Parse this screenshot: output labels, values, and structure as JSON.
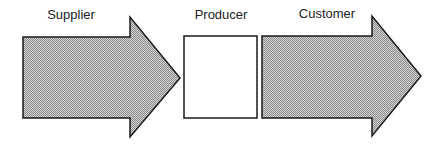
{
  "diagram": {
    "title": "",
    "nodes": [
      {
        "id": "supplier",
        "label": "Supplier",
        "shape": "arrow-right",
        "fill": "hatched-gray"
      },
      {
        "id": "producer",
        "label": "Producer",
        "shape": "rectangle",
        "fill": "#ffffff"
      },
      {
        "id": "customer",
        "label": "Customer",
        "shape": "arrow-right",
        "fill": "hatched-gray"
      }
    ],
    "flow": [
      "supplier",
      "producer",
      "customer"
    ]
  },
  "colors": {
    "stroke": "#1a1a1a",
    "arrow_fill": "#b8b8b8",
    "box_fill": "#ffffff"
  }
}
